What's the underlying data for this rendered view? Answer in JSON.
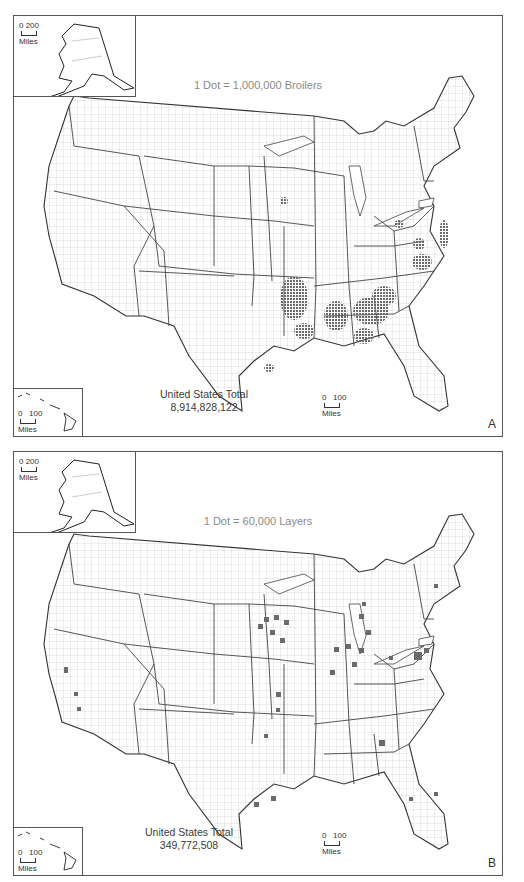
{
  "figure": {
    "panels": [
      {
        "id": "A",
        "legend": "1 Dot = 1,000,000 Broilers",
        "total_label": "United States Total",
        "total_value": "8,914,828,122",
        "panel_letter": "A",
        "alaska_scale": {
          "values": "0 200",
          "unit": "Miles"
        },
        "hawaii_scale": {
          "values": "0   100",
          "unit": "Miles"
        },
        "main_scale": {
          "values": "0   100",
          "unit": "Miles"
        },
        "dot_color": "#6a6a6a",
        "concentrations": [
          "Arkansas/NW",
          "Georgia",
          "Alabama",
          "Mississippi",
          "North Carolina",
          "Delmarva",
          "Shenandoah Valley",
          "East Texas"
        ]
      },
      {
        "id": "B",
        "legend": "1 Dot = 60,000 Layers",
        "total_label": "United States Total",
        "total_value": "349,772,508",
        "panel_letter": "B",
        "alaska_scale": {
          "values": "0 200",
          "unit": "Miles"
        },
        "hawaii_scale": {
          "values": "0   100",
          "unit": "Miles"
        },
        "main_scale": {
          "values": "0   100",
          "unit": "Miles"
        },
        "dot_color": "#6a6a6a",
        "concentrations": [
          "Iowa",
          "Indiana",
          "Ohio",
          "Pennsylvania",
          "Georgia",
          "Minnesota",
          "Michigan",
          "California"
        ]
      }
    ],
    "colors": {
      "border": "#555555",
      "state_line": "#444444",
      "county_line": "#b5b5b5",
      "legend_text": "#8a8a8a",
      "dots": "#6a6a6a"
    }
  }
}
